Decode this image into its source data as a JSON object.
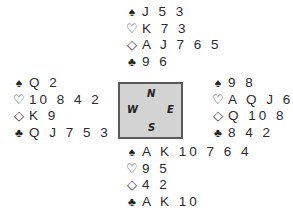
{
  "diagram": {
    "type": "bridge-deal",
    "compass": {
      "north": "N",
      "south": "S",
      "west": "W",
      "east": "E"
    },
    "suit_symbols": {
      "spades": "♠",
      "hearts": "♡",
      "diamonds": "◇",
      "clubs": "♣"
    },
    "hands": {
      "north": {
        "spades": "J 5 3",
        "hearts": "K 7 3",
        "diamonds": "A J 7 6 5",
        "clubs": "9 6"
      },
      "west": {
        "spades": "Q 2",
        "hearts": "10 8 4 2",
        "diamonds": "K 9",
        "clubs": "Q J 7 5 3"
      },
      "east": {
        "spades": "9 8",
        "hearts": "A Q J 6",
        "diamonds": "Q 10 8 3",
        "clubs": "8 4 2"
      },
      "south": {
        "spades": "A K 10 7 6 4",
        "hearts": "9 5",
        "diamonds": "4 2",
        "clubs": "A K 10"
      }
    }
  }
}
